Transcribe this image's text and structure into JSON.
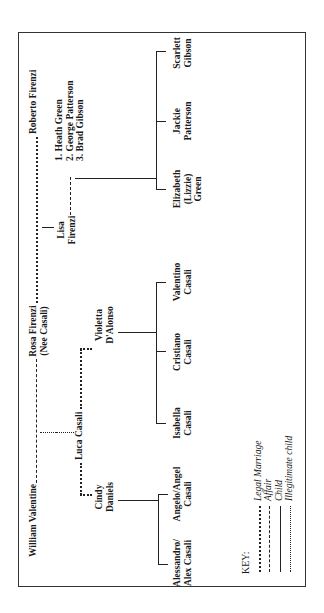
{
  "diagram": {
    "type": "family-tree",
    "orientation": "rotated-90-ccw",
    "generation1": {
      "william": "William Valentine",
      "rosa_line1": "Rosa Firenzi",
      "rosa_line2": "(Nee Casali)",
      "roberto": "Roberto Firenzi"
    },
    "generation2": {
      "cindy_line1": "Cindy",
      "cindy_line2": "Daniels",
      "luca": "Luca Casali",
      "violetta_line1": "Violetta",
      "violetta_line2": "D'Alonso",
      "lisa_line1": "Lisa",
      "lisa_line2": "Firenzi",
      "lisa_partners": [
        "1. Heath Green",
        "2. George Patterson",
        "3. Brad Gibson"
      ]
    },
    "generation3": {
      "cindy_children": [
        {
          "line1": "Alessandro/",
          "line2": "Alex Casali"
        },
        {
          "line1": "Angelo/Angel",
          "line2": "Casali"
        }
      ],
      "violetta_children": [
        {
          "line1": "Isabella",
          "line2": "Casali"
        },
        {
          "line1": "Cristiano",
          "line2": "Casali"
        },
        {
          "line1": "Valentino",
          "line2": "Casali"
        }
      ],
      "lisa_children": [
        {
          "line1": "Elizabeth",
          "line2": "(Lizzie)",
          "line3": "Green"
        },
        {
          "line1": "Jackie",
          "line2": "Patterson"
        },
        {
          "line1": "Scarlett",
          "line2": "Gibson"
        }
      ]
    },
    "relationships": [
      {
        "from": "William Valentine",
        "to": "Rosa Firenzi",
        "type": "Affair"
      },
      {
        "from": "Rosa Firenzi",
        "to": "Roberto Firenzi",
        "type": "Legal Marriage"
      },
      {
        "from": "William Valentine & Rosa Firenzi",
        "to": "Luca Casali",
        "type": "Illegitimate child"
      },
      {
        "from": "Rosa Firenzi & Roberto Firenzi",
        "to": "Lisa Firenzi",
        "type": "Child"
      },
      {
        "from": "Luca Casali",
        "to": "Cindy Daniels",
        "type": "Legal Marriage"
      },
      {
        "from": "Luca Casali",
        "to": "Violetta D'Alonso",
        "type": "Legal Marriage"
      },
      {
        "from": "Lisa Firenzi",
        "to": "Heath Green / George Patterson / Brad Gibson",
        "type": "Affair"
      }
    ]
  },
  "key": {
    "title": "KEY:",
    "items": [
      {
        "style": "dotted-dash",
        "label": "Legal Marriage"
      },
      {
        "style": "dashed",
        "label": "Affair"
      },
      {
        "style": "solid",
        "label": "Child"
      },
      {
        "style": "dotted",
        "label": "Illegitimate child"
      }
    ]
  },
  "colors": {
    "ink": "#1a1a1a",
    "background": "#ffffff",
    "frame": "#333333"
  }
}
